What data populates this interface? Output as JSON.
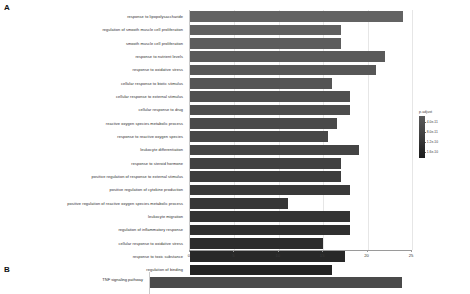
{
  "figure": {
    "panel_a_letter": "A",
    "panel_b_letter": "B"
  },
  "chart_data": [
    {
      "type": "bar",
      "panel": "A",
      "orientation": "horizontal",
      "title": "",
      "xlabel": "",
      "ylabel": "",
      "xlim": [
        0,
        25
      ],
      "xticks": [
        0,
        5,
        10,
        15,
        20,
        25
      ],
      "xticklabels": [
        "0",
        "5",
        "10",
        "15",
        "20",
        "25"
      ],
      "grid": false,
      "legend": {
        "title": "p.adjust",
        "position": "right",
        "ticklabels": [
          "4.0e-11",
          "8.0e-11",
          "1.2e-10",
          "1.6e-10"
        ],
        "low_color": "#5a5a5a",
        "high_color": "#1d1d1d"
      },
      "categories": [
        "response to lipopolysaccharide",
        "regulation of smooth muscle cell proliferation",
        "smooth muscle cell proliferation",
        "response to nutrient levels",
        "response to oxidative stress",
        "cellular response to biotic stimulus",
        "cellular response to external stimulus",
        "cellular response to drug",
        "reactive oxygen species metabolic process",
        "response to reactive oxygen species",
        "leukocyte differentiation",
        "response to steroid hormone",
        "positive regulation of response to external stimulus",
        "positive regulation of cytokine production",
        "positive regulation of reactive oxygen species metabolic process",
        "leukocyte migration",
        "regulation of inflammatory response",
        "cellular response to oxidative stress",
        "response to toxic substance",
        "regulation of binding"
      ],
      "values": [
        24,
        17,
        17,
        22,
        21,
        16,
        18,
        18,
        16.5,
        15.5,
        19,
        17,
        17,
        18,
        11,
        18,
        18,
        15,
        17.5,
        16
      ],
      "bar_colors": [
        "#636363",
        "#606060",
        "#5d5d5d",
        "#5a5a5a",
        "#575757",
        "#545454",
        "#505050",
        "#4d4d4d",
        "#4a4a4a",
        "#474747",
        "#444444",
        "#414141",
        "#3d3d3d",
        "#3a3a3a",
        "#373737",
        "#343434",
        "#303030",
        "#2c2c2c",
        "#282828",
        "#232323"
      ]
    },
    {
      "type": "bar",
      "panel": "B",
      "orientation": "horizontal",
      "title": "",
      "xlabel": "",
      "ylabel": "",
      "xlim": [
        0,
        25
      ],
      "categories": [
        "TNF signaling pathway"
      ],
      "values": [
        24
      ],
      "bar_colors": [
        "#4a4a4a"
      ]
    }
  ]
}
